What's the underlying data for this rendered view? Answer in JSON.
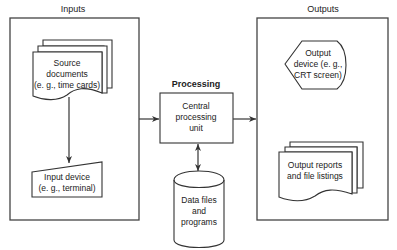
{
  "diagram": {
    "sections": {
      "inputs": {
        "title": "Inputs"
      },
      "processing": {
        "title": "Processing"
      },
      "outputs": {
        "title": "Outputs"
      }
    },
    "nodes": {
      "source_documents": {
        "shape": "multi-document",
        "lines": [
          "Source",
          "documents",
          "(e. g., time cards)"
        ]
      },
      "input_device": {
        "shape": "manual-input",
        "lines": [
          "Input device",
          "(e. g., terminal)"
        ]
      },
      "cpu": {
        "shape": "process",
        "lines": [
          "Central",
          "processing",
          "unit"
        ]
      },
      "data_files": {
        "shape": "cylinder",
        "lines": [
          "Data files",
          "and",
          "programs"
        ]
      },
      "output_device": {
        "shape": "display",
        "lines": [
          "Output",
          "device (e. g.,",
          "CRT screen)"
        ]
      },
      "output_reports": {
        "shape": "multi-document",
        "lines": [
          "Output reports",
          "and file listings"
        ]
      }
    },
    "edges": [
      {
        "from": "source_documents",
        "to": "input_device",
        "type": "arrow"
      },
      {
        "from": "inputs",
        "to": "cpu",
        "type": "arrow"
      },
      {
        "from": "cpu",
        "to": "outputs",
        "type": "arrow"
      },
      {
        "from": "cpu",
        "to": "data_files",
        "type": "bidirectional-arrow"
      }
    ],
    "colors": {
      "line": "#333333",
      "background": "#ffffff",
      "text": "#222222"
    }
  }
}
